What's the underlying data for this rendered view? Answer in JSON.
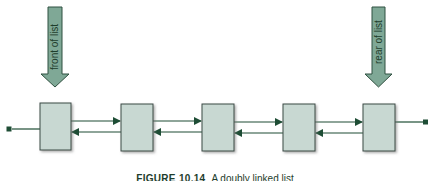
{
  "diagram": {
    "type": "doubly-linked-list",
    "pointers": [
      {
        "label": "front of list",
        "target_node": 0
      },
      {
        "label": "rear of list",
        "target_node": 4
      }
    ],
    "node_count": 5,
    "nodes": [
      {
        "index": 0
      },
      {
        "index": 1
      },
      {
        "index": 2
      },
      {
        "index": 3
      },
      {
        "index": 4
      }
    ],
    "links": [
      "next",
      "prev"
    ],
    "colors": {
      "node_fill": "#c8d8d2",
      "node_border": "#3a4a44",
      "arrow_fill": "#7fa896",
      "arrow_border": "#2f5040",
      "link_line": "#1e4d35",
      "caption_text": "#1e3d2c"
    }
  },
  "caption": {
    "figure_label": "FIGURE 10.14",
    "text": "A doubly linked list"
  }
}
